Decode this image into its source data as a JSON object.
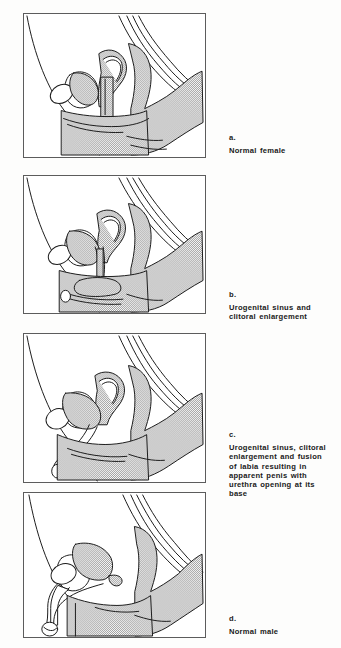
{
  "figure": {
    "name": "Development of external genitalia variants",
    "background_color": "#fdfdfc",
    "ink_color": "#1a1a1a",
    "shade_color": "#b9b9b9",
    "frame_color": "#5c5c5c",
    "panel_count": 4
  },
  "panels": [
    {
      "id": "a",
      "letter": "a.",
      "caption": "Normal female",
      "alt": "Midsagittal section of female pelvis showing uterus, bladder, vagina and rectum with stippled shading"
    },
    {
      "id": "b",
      "letter": "b.",
      "caption": "Urogenital sinus and\nclitoral enlargement",
      "alt": "Midsagittal pelvic section showing a urogenital sinus and an enlarged clitoris"
    },
    {
      "id": "c",
      "letter": "c.",
      "caption": "Urogenital sinus, clitoral\nenlargement and fusion\nof labia resulting in\napparent penis with\nurethra opening at its\nbase",
      "alt": "Midsagittal pelvic section showing urogenital sinus with fused labia forming an apparent penis"
    },
    {
      "id": "d",
      "letter": "d.",
      "caption": "Normal male",
      "alt": "Midsagittal section of male pelvis showing bladder, prostate, penis and rectum with stippled shading"
    }
  ]
}
